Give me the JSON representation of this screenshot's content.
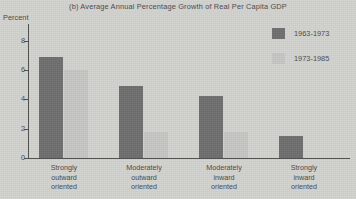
{
  "chart_data": {
    "type": "bar",
    "title": "(b) Average Annual Percentage Growth of Real Per Capita GDP",
    "xlabel": "",
    "ylabel": "Percent",
    "ylim": [
      0,
      9.2
    ],
    "yticks": [
      0,
      2,
      4,
      6,
      8
    ],
    "ytick_labels": [
      "0",
      "2",
      "4",
      "6",
      "8"
    ],
    "grid": false,
    "legend_position": "top-right",
    "categories": [
      "Strongly outward oriented",
      "Moderately outward oriented",
      "Moderately inward oriented",
      "Strongly inward oriented"
    ],
    "category_lines": [
      [
        "Strongly",
        "outward",
        "oriented"
      ],
      [
        "Moderately",
        "outward",
        "oriented"
      ],
      [
        "Moderately",
        "inward",
        "oriented"
      ],
      [
        "Strongly",
        "inward",
        "oriented"
      ]
    ],
    "series": [
      {
        "name": "1963-1973",
        "color": "#6e6e6e",
        "values": [
          6.9,
          4.9,
          4.2,
          1.5
        ]
      },
      {
        "name": "1973-1985",
        "color": "#c6c6c4",
        "values": [
          6.0,
          1.8,
          1.8,
          0.0
        ]
      }
    ]
  },
  "legend": {
    "items": [
      {
        "label": "1963-1973",
        "color": "#6e6e6e"
      },
      {
        "label": "1973-1985",
        "color": "#c6c6c4"
      }
    ]
  },
  "colors": {
    "background": "#d2d2cf",
    "axis": "#4d4d4d",
    "text": "#4a4a4a",
    "series_1963_1973": "#6e6e6e",
    "series_1973_1985": "#c6c6c4"
  }
}
